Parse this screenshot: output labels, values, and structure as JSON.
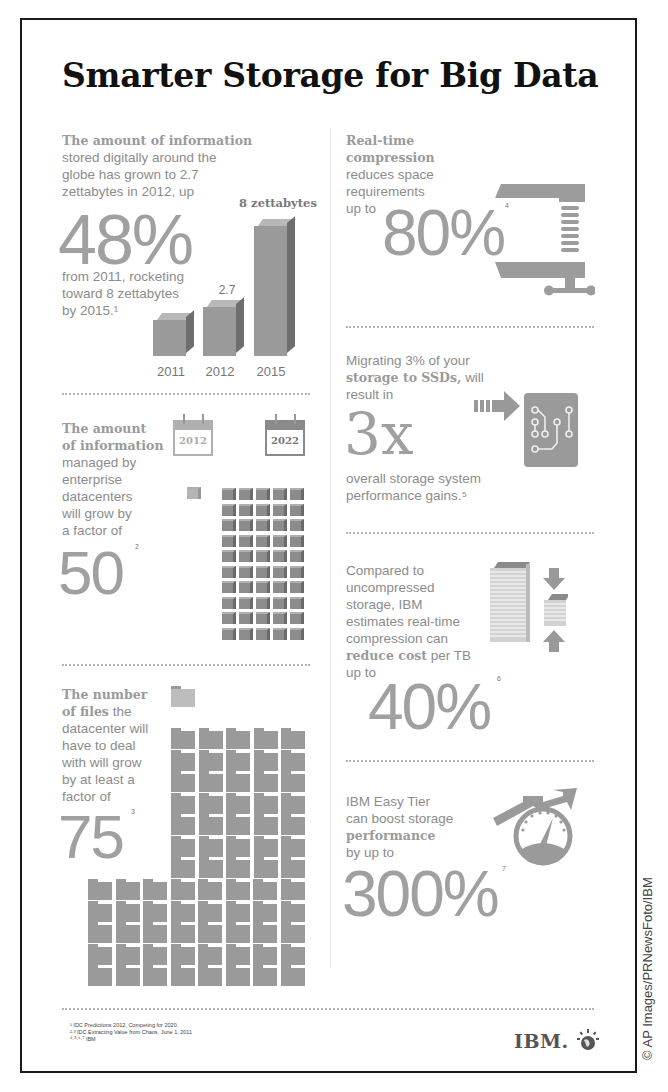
{
  "title": "Smarter Storage for Big Data",
  "sections": {
    "digital_info": {
      "lead_bold": "The amount of information",
      "lead_rest": [
        "stored digitally around the",
        "globe has grown to 2.7",
        "zettabytes in 2012, up"
      ],
      "big_number": "48%",
      "tail": [
        "from 2011, rocketing",
        "toward 8 zettabytes",
        "by 2015.¹"
      ]
    },
    "datacenter_info": {
      "lead_bold": [
        "The amount",
        "of information"
      ],
      "lead_rest": [
        "managed by",
        "enterprise",
        "datacenters",
        "will grow by",
        "a factor of"
      ],
      "big_number": "50",
      "footnote": "2",
      "calendar_from": "2012",
      "calendar_to": "2022",
      "cube_count_from": 1,
      "cube_count_to": 50
    },
    "files": {
      "lead_bold": [
        "The number",
        "of files"
      ],
      "lead_line1_rest": "the",
      "lead_rest": [
        "datacenter will",
        "have to deal",
        "with will grow",
        "by at least a",
        "factor of"
      ],
      "big_number": "75",
      "footnote": "3",
      "folder_count": 75
    },
    "compression": {
      "lead_bold": [
        "Real-time",
        "compression"
      ],
      "lead_rest": [
        "reduces space",
        "requirements",
        "up to"
      ],
      "big_number": "80%",
      "footnote": "4"
    },
    "ssd": {
      "line1": "Migrating 3% of your",
      "line2_bold": "storage to SSDs,",
      "line2_rest": "will",
      "line3": "result in",
      "big_number": "3x",
      "tail": [
        "overall storage system",
        "performance gains.⁵"
      ]
    },
    "cost": {
      "lead": [
        "Compared to",
        "uncompressed",
        "storage, IBM",
        "estimates real-time",
        "compression can"
      ],
      "line_bold": "reduce cost",
      "line_rest": "per TB",
      "prefix": "up to",
      "big_number": "40%",
      "footnote": "6"
    },
    "easy_tier": {
      "lead": [
        "IBM Easy Tier",
        "can boost storage"
      ],
      "bold": "performance",
      "after": "by up to",
      "big_number": "300%",
      "footnote": "7"
    }
  },
  "footnotes": [
    "¹ IDC Predictions 2012, Competing for 2020",
    "²·³ IDC Extracting Value from Chaos, June 1, 2011",
    "⁴·⁵·⁶·⁷ IBM"
  ],
  "logo": "IBM.",
  "credit": "© AP Images/PRNewsFoto/IBM",
  "chart_data": {
    "type": "bar",
    "categories": [
      "2011",
      "2012",
      "2015"
    ],
    "values": [
      1.8,
      2.7,
      8
    ],
    "value_labels": [
      "",
      "2.7",
      "8 zettabytes"
    ],
    "xlabel": "",
    "ylabel": "Zettabytes",
    "ylim": [
      0,
      8
    ],
    "grid": false
  },
  "colors": {
    "text": "#8c8c8c",
    "title": "#111111",
    "bar": "#9a9a9a",
    "frame": "#1a1a1a"
  }
}
